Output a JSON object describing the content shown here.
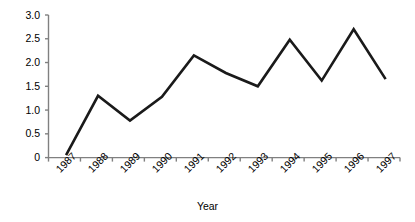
{
  "chart_data": {
    "type": "line",
    "title": "",
    "subtitle": "",
    "xlabel": "Year",
    "ylabel": "",
    "categories": [
      "1987",
      "1988",
      "1989",
      "1990",
      "1991",
      "1992",
      "1993",
      "1994",
      "1995",
      "1996",
      "1997"
    ],
    "values": [
      0.05,
      1.3,
      0.78,
      1.28,
      2.15,
      1.78,
      1.5,
      2.48,
      1.62,
      2.7,
      1.65
    ],
    "series": [
      {
        "name": "",
        "values": [
          0.05,
          1.3,
          0.78,
          1.28,
          2.15,
          1.78,
          1.5,
          2.48,
          1.62,
          2.7,
          1.65
        ]
      }
    ],
    "ylim": [
      0,
      3.0
    ],
    "yticks": [
      "0",
      "0.5",
      "1.0",
      "1.5",
      "2.0",
      "2.5",
      "3.0"
    ],
    "ytick_values": [
      0,
      0.5,
      1.0,
      1.5,
      2.0,
      2.5,
      3.0
    ],
    "xtick_labels": [
      "1987",
      "1988",
      "1989",
      "1990",
      "1991",
      "1992",
      "1993",
      "1994",
      "1995",
      "1996",
      "1997"
    ],
    "grid": false,
    "legend": "none",
    "line_color": "#1a1a1a",
    "axis_color": "#808080",
    "background_color": "#ffffff",
    "xtick_rotation": -45,
    "marker": "none"
  },
  "axis": {
    "x_label_text": "Year"
  }
}
